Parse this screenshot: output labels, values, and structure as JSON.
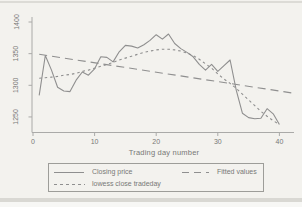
{
  "figure": {
    "background": "#f3f2ee",
    "line_color": "#8f8f8f",
    "axis_color": "#aaaaa8",
    "text_color": "#787876"
  },
  "chart_data": {
    "type": "line",
    "title": "",
    "xlabel": "Trading day number",
    "ylabel": "",
    "grid": false,
    "legend_position": "bottom",
    "xlim": [
      0,
      42.5
    ],
    "ylim": [
      1233,
      1406
    ],
    "x_ticks": [
      0,
      10,
      20,
      30,
      40
    ],
    "y_ticks": [
      1250,
      1300,
      1350,
      1400
    ],
    "x": [
      1,
      2,
      3,
      4,
      5,
      6,
      7,
      8,
      9,
      10,
      11,
      12,
      13,
      14,
      15,
      16,
      17,
      18,
      19,
      20,
      21,
      22,
      23,
      24,
      25,
      26,
      27,
      28,
      29,
      30,
      31,
      32,
      33,
      34,
      35,
      36,
      37,
      38,
      39,
      40
    ],
    "series": [
      {
        "name": "Closing price",
        "style": "solid",
        "values": [
          1284,
          1347,
          1324,
          1297,
          1291,
          1290,
          1308,
          1321,
          1316,
          1326,
          1345,
          1344,
          1337,
          1353,
          1363,
          1362,
          1359,
          1364,
          1371,
          1380,
          1373,
          1381,
          1366,
          1358,
          1352,
          1345,
          1333,
          1324,
          1333,
          1322,
          1331,
          1340,
          1292,
          1256,
          1249,
          1247,
          1248,
          1263,
          1255,
          1238
        ]
      },
      {
        "name": "lowess close tradeday",
        "style": "short-dash",
        "values": [
          1311,
          1312,
          1313,
          1314,
          1316,
          1317,
          1319,
          1322,
          1324,
          1327,
          1330,
          1333,
          1336,
          1340,
          1343,
          1346,
          1349,
          1352,
          1354,
          1356,
          1357,
          1357,
          1356,
          1354,
          1351,
          1347,
          1341,
          1334,
          1327,
          1318,
          1310,
          1303,
          1295,
          1286,
          1277,
          1268,
          1259,
          1251,
          1244,
          1238
        ]
      },
      {
        "name": "Fitted values",
        "style": "long-dash",
        "x": [
          1,
          42
        ],
        "values": [
          1349,
          1288
        ]
      }
    ]
  },
  "legend": {
    "items": [
      {
        "label": "Closing price",
        "style": "solid"
      },
      {
        "label": "Fitted values",
        "style": "long-dash"
      },
      {
        "label": "lowess close tradeday",
        "style": "short-dash"
      }
    ]
  }
}
